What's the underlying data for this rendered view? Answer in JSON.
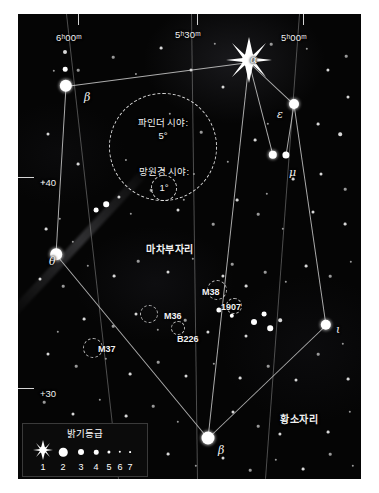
{
  "chart_data": {
    "type": "scatter",
    "projection": "equatorial",
    "ra_ticks": [
      {
        "label": "6ʰ00ᵐ",
        "x": 38,
        "y": 18
      },
      {
        "label": "5ʰ30ᵐ",
        "x": 157,
        "y": 15
      },
      {
        "label": "5ʰ00ᵐ",
        "x": 263,
        "y": 18
      }
    ],
    "dec_ticks": [
      {
        "label": "+40",
        "x": 22,
        "y": 163
      },
      {
        "label": "+30",
        "x": 22,
        "y": 374
      }
    ],
    "constellation_labels": [
      {
        "label": "마차부자리",
        "x": 128,
        "y": 227
      },
      {
        "label": "황소자리",
        "x": 262,
        "y": 397
      }
    ],
    "star_labels": [
      {
        "label": "α",
        "x": 232,
        "y": 39
      },
      {
        "label": "β",
        "x": 66,
        "y": 77
      },
      {
        "label": "ε",
        "x": 259,
        "y": 94
      },
      {
        "label": "μ",
        "x": 271,
        "y": 152
      },
      {
        "label": "θ",
        "x": 31,
        "y": 241
      },
      {
        "label": "ι",
        "x": 318,
        "y": 309
      },
      {
        "label": "β",
        "x": 200,
        "y": 430
      }
    ],
    "deep_sky_labels": [
      {
        "label": "M38",
        "x": 184,
        "y": 273
      },
      {
        "label": "1907",
        "x": 203,
        "y": 288
      },
      {
        "label": "M36",
        "x": 146,
        "y": 297
      },
      {
        "label": "B226",
        "x": 159,
        "y": 320
      },
      {
        "label": "M37",
        "x": 80,
        "y": 330
      }
    ],
    "fov_finder": {
      "label_line1": "파인더 시야:",
      "label_line2": "5°",
      "cx": 145,
      "cy": 133,
      "radius": 53
    },
    "fov_telescope": {
      "label_line1": "망원경 시야:",
      "label_line2": "1°",
      "cx": 146,
      "cy": 174,
      "radius": 12
    },
    "legend": {
      "title": "밝기등급",
      "magnitudes": [
        "1",
        "2",
        "3",
        "4",
        "5",
        "6",
        "7"
      ],
      "dot_sizes_px": [
        14,
        8.5,
        6,
        4.5,
        3.2,
        2.4,
        1.8
      ]
    },
    "colors": {
      "sky": "#050505",
      "star": "#ffffff",
      "line": "#c9c9c9",
      "grid": "#8a8a8a",
      "text": "#f2f2f2",
      "page": "#ffffff"
    }
  },
  "stars": [
    {
      "x": 231,
      "y": 48,
      "mag": 0,
      "big": true
    },
    {
      "x": 48,
      "y": 72,
      "r": 6.2
    },
    {
      "x": 276,
      "y": 90,
      "r": 5.0
    },
    {
      "x": 255,
      "y": 141,
      "r": 4.2
    },
    {
      "x": 268,
      "y": 141,
      "r": 3.6
    },
    {
      "x": 38,
      "y": 240,
      "r": 5.8
    },
    {
      "x": 308,
      "y": 311,
      "r": 5.2
    },
    {
      "x": 190,
      "y": 424,
      "r": 6.5
    },
    {
      "x": 47,
      "y": 38,
      "r": 2.0
    },
    {
      "x": 47,
      "y": 55,
      "r": 2.3
    },
    {
      "x": 60,
      "y": 56,
      "r": 1.3
    },
    {
      "x": 36,
      "y": 57,
      "r": 1.2
    },
    {
      "x": 95,
      "y": 43,
      "r": 1.3
    },
    {
      "x": 118,
      "y": 60,
      "r": 1.1
    },
    {
      "x": 143,
      "y": 34,
      "r": 1.4
    },
    {
      "x": 173,
      "y": 56,
      "r": 1.5
    },
    {
      "x": 197,
      "y": 30,
      "r": 1.2
    },
    {
      "x": 205,
      "y": 73,
      "r": 1.5
    },
    {
      "x": 253,
      "y": 30,
      "r": 1.3
    },
    {
      "x": 289,
      "y": 35,
      "r": 1.2
    },
    {
      "x": 310,
      "y": 56,
      "r": 1.6
    },
    {
      "x": 328,
      "y": 42,
      "r": 1.3
    },
    {
      "x": 330,
      "y": 83,
      "r": 1.5
    },
    {
      "x": 300,
      "y": 110,
      "r": 1.4
    },
    {
      "x": 322,
      "y": 120,
      "r": 1.8
    },
    {
      "x": 250,
      "y": 110,
      "r": 1.2
    },
    {
      "x": 237,
      "y": 126,
      "r": 1.4
    },
    {
      "x": 275,
      "y": 165,
      "r": 1.4
    },
    {
      "x": 249,
      "y": 180,
      "r": 1.2
    },
    {
      "x": 303,
      "y": 160,
      "r": 1.5
    },
    {
      "x": 327,
      "y": 175,
      "r": 1.3
    },
    {
      "x": 295,
      "y": 198,
      "r": 1.5
    },
    {
      "x": 327,
      "y": 210,
      "r": 1.4
    },
    {
      "x": 265,
      "y": 215,
      "r": 1.2
    },
    {
      "x": 240,
      "y": 200,
      "r": 1.3
    },
    {
      "x": 219,
      "y": 186,
      "r": 1.4
    },
    {
      "x": 195,
      "y": 210,
      "r": 1.3
    },
    {
      "x": 160,
      "y": 196,
      "r": 1.5
    },
    {
      "x": 133,
      "y": 176,
      "r": 1.3
    },
    {
      "x": 113,
      "y": 200,
      "r": 1.2
    },
    {
      "x": 88,
      "y": 190,
      "r": 2.8
    },
    {
      "x": 78,
      "y": 196,
      "r": 2.4
    },
    {
      "x": 101,
      "y": 183,
      "r": 1.6
    },
    {
      "x": 60,
      "y": 150,
      "r": 1.4
    },
    {
      "x": 30,
      "y": 120,
      "r": 1.5
    },
    {
      "x": 25,
      "y": 168,
      "r": 1.3
    },
    {
      "x": 42,
      "y": 205,
      "r": 1.2
    },
    {
      "x": 28,
      "y": 215,
      "r": 1.4
    },
    {
      "x": 55,
      "y": 228,
      "r": 1.2
    },
    {
      "x": 22,
      "y": 265,
      "r": 1.5
    },
    {
      "x": 45,
      "y": 272,
      "r": 1.3
    },
    {
      "x": 70,
      "y": 252,
      "r": 1.2
    },
    {
      "x": 96,
      "y": 262,
      "r": 1.4
    },
    {
      "x": 120,
      "y": 247,
      "r": 1.3
    },
    {
      "x": 150,
      "y": 258,
      "r": 1.5
    },
    {
      "x": 175,
      "y": 245,
      "r": 1.2
    },
    {
      "x": 205,
      "y": 262,
      "r": 1.6
    },
    {
      "x": 214,
      "y": 250,
      "r": 1.3
    },
    {
      "x": 228,
      "y": 272,
      "r": 1.4
    },
    {
      "x": 247,
      "y": 258,
      "r": 1.3
    },
    {
      "x": 268,
      "y": 268,
      "r": 1.2
    },
    {
      "x": 288,
      "y": 252,
      "r": 1.4
    },
    {
      "x": 312,
      "y": 262,
      "r": 1.3
    },
    {
      "x": 333,
      "y": 248,
      "r": 1.2
    },
    {
      "x": 201,
      "y": 296,
      "r": 2.6
    },
    {
      "x": 214,
      "y": 302,
      "r": 2.2
    },
    {
      "x": 236,
      "y": 308,
      "r": 3.0
    },
    {
      "x": 246,
      "y": 300,
      "r": 2.4
    },
    {
      "x": 252,
      "y": 314,
      "r": 2.8
    },
    {
      "x": 262,
      "y": 306,
      "r": 1.8
    },
    {
      "x": 228,
      "y": 322,
      "r": 1.5
    },
    {
      "x": 190,
      "y": 318,
      "r": 1.6
    },
    {
      "x": 167,
      "y": 306,
      "r": 1.3
    },
    {
      "x": 140,
      "y": 316,
      "r": 1.2
    },
    {
      "x": 118,
      "y": 300,
      "r": 1.5
    },
    {
      "x": 95,
      "y": 312,
      "r": 1.3
    },
    {
      "x": 66,
      "y": 305,
      "r": 1.4
    },
    {
      "x": 40,
      "y": 318,
      "r": 1.2
    },
    {
      "x": 30,
      "y": 340,
      "r": 1.5
    },
    {
      "x": 58,
      "y": 352,
      "r": 1.3
    },
    {
      "x": 88,
      "y": 345,
      "r": 1.2
    },
    {
      "x": 112,
      "y": 360,
      "r": 1.4
    },
    {
      "x": 140,
      "y": 348,
      "r": 1.3
    },
    {
      "x": 168,
      "y": 362,
      "r": 1.5
    },
    {
      "x": 196,
      "y": 350,
      "r": 1.2
    },
    {
      "x": 222,
      "y": 364,
      "r": 1.4
    },
    {
      "x": 250,
      "y": 352,
      "r": 1.3
    },
    {
      "x": 278,
      "y": 366,
      "r": 1.5
    },
    {
      "x": 300,
      "y": 340,
      "r": 1.3
    },
    {
      "x": 325,
      "y": 330,
      "r": 1.2
    },
    {
      "x": 330,
      "y": 365,
      "r": 1.4
    },
    {
      "x": 26,
      "y": 388,
      "r": 1.3
    },
    {
      "x": 55,
      "y": 400,
      "r": 1.5
    },
    {
      "x": 82,
      "y": 386,
      "r": 1.2
    },
    {
      "x": 108,
      "y": 402,
      "r": 1.4
    },
    {
      "x": 135,
      "y": 392,
      "r": 1.3
    },
    {
      "x": 160,
      "y": 408,
      "r": 1.2
    },
    {
      "x": 215,
      "y": 398,
      "r": 1.5
    },
    {
      "x": 240,
      "y": 412,
      "r": 1.3
    },
    {
      "x": 262,
      "y": 420,
      "r": 1.6
    },
    {
      "x": 285,
      "y": 404,
      "r": 1.3
    },
    {
      "x": 310,
      "y": 418,
      "r": 1.4
    },
    {
      "x": 332,
      "y": 398,
      "r": 1.2
    },
    {
      "x": 150,
      "y": 440,
      "r": 1.4
    },
    {
      "x": 178,
      "y": 452,
      "r": 1.2
    },
    {
      "x": 205,
      "y": 444,
      "r": 1.5
    },
    {
      "x": 232,
      "y": 456,
      "r": 1.3
    },
    {
      "x": 258,
      "y": 446,
      "r": 1.2
    },
    {
      "x": 285,
      "y": 455,
      "r": 1.4
    },
    {
      "x": 312,
      "y": 440,
      "r": 1.3
    },
    {
      "x": 335,
      "y": 452,
      "r": 1.2
    },
    {
      "x": 152,
      "y": 100,
      "r": 1.2
    },
    {
      "x": 183,
      "y": 118,
      "r": 1.3
    },
    {
      "x": 210,
      "y": 148,
      "r": 1.2
    },
    {
      "x": 176,
      "y": 160,
      "r": 1.1
    },
    {
      "x": 124,
      "y": 108,
      "r": 1.1
    },
    {
      "x": 108,
      "y": 146,
      "r": 1.1
    },
    {
      "x": 166,
      "y": 186,
      "r": 1.2
    }
  ],
  "constellation_lines": [
    {
      "x1": 48,
      "y1": 72,
      "x2": 231,
      "y2": 48
    },
    {
      "x1": 231,
      "y1": 48,
      "x2": 276,
      "y2": 90
    },
    {
      "x1": 276,
      "y1": 90,
      "x2": 308,
      "y2": 311
    },
    {
      "x1": 308,
      "y1": 311,
      "x2": 190,
      "y2": 424
    },
    {
      "x1": 190,
      "y1": 424,
      "x2": 38,
      "y2": 240
    },
    {
      "x1": 38,
      "y1": 240,
      "x2": 48,
      "y2": 72
    },
    {
      "x1": 231,
      "y1": 48,
      "x2": 255,
      "y2": 141
    },
    {
      "x1": 276,
      "y1": 90,
      "x2": 268,
      "y2": 141
    },
    {
      "x1": 231,
      "y1": 48,
      "x2": 190,
      "y2": 424
    }
  ]
}
